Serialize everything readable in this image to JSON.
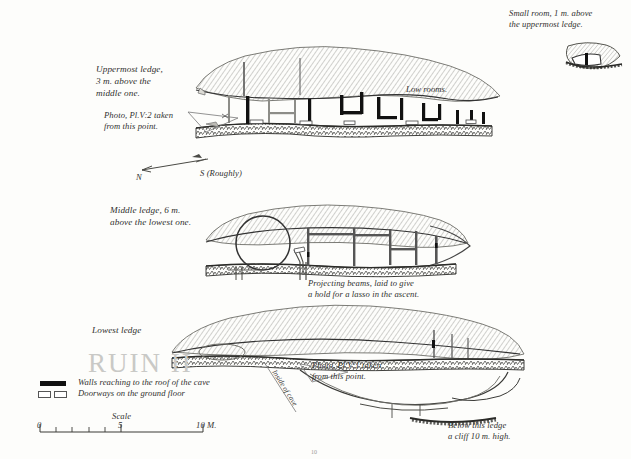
{
  "plate": {
    "title_watermark": "RUIN II",
    "plate_number": "10"
  },
  "annotations": {
    "small_room": "Small room, 1 m. above\nthe uppermost ledge.",
    "uppermost_ledge": "Uppermost ledge,\n3 m. above the\n  middle one.",
    "photo_plv2": "Photo, Pl.V:2 taken\n from  this point.",
    "low_rooms": "Low rooms.",
    "middle_ledge": "Middle ledge, 6 m.\nabove the lowest one.",
    "projecting_beams": "Projecting beams, laid to give\n a hold for a lasso in the ascent.",
    "lowest_ledge": "Lowest ledge",
    "photo_plv1": "Photo, Pl.V:1 taken\n  from  this point.",
    "inside_of_cave": "Inside of cave",
    "below_this_ledge": "Below this ledge\na cliff 10 m. high."
  },
  "compass": {
    "north_label": "N",
    "south_label": "S (Roughly)"
  },
  "legend": {
    "items": [
      {
        "symbol": "solid-black-bar",
        "label": "Walls reaching to the roof of the cave"
      },
      {
        "symbol": "open-outline-bar",
        "label": "Doorways on the ground floor"
      }
    ]
  },
  "scale": {
    "title": "Scale",
    "ticks": [
      "0",
      "5",
      "10 M."
    ],
    "min": 0,
    "max": 10,
    "unit": "M."
  },
  "colors": {
    "ink": "#222222",
    "paper": "#fdfdfb",
    "hatch": "#8d8d88",
    "wall_solid": "#111111",
    "watermark": "#c9c9c6"
  }
}
